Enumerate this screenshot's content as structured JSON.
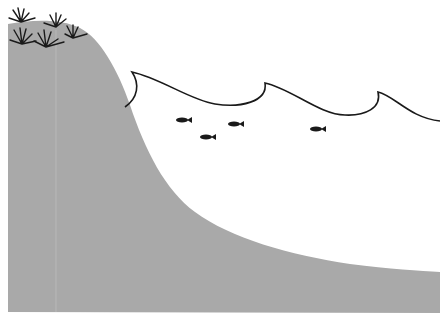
{
  "scene": {
    "title": "Coastal cliff and ocean waves illustration",
    "colors": {
      "land": "#a9a9a9",
      "ink": "#1a1a1a",
      "background": "#ffffff"
    },
    "elements": {
      "land": "continental slope",
      "vegetation": "grass tufts",
      "waves": "ocean wave line",
      "fish": [
        {
          "x": 182,
          "y": 120
        },
        {
          "x": 206,
          "y": 137
        },
        {
          "x": 234,
          "y": 124
        },
        {
          "x": 316,
          "y": 129
        }
      ]
    }
  }
}
